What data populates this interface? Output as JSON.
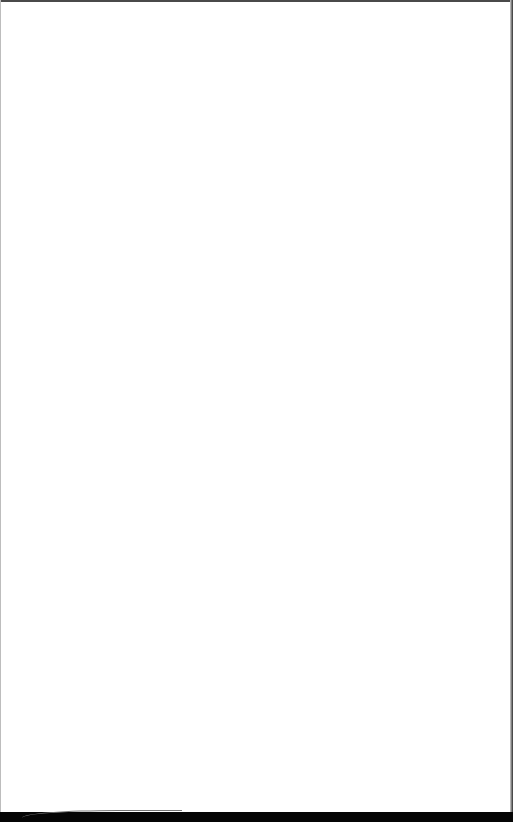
{
  "page": {
    "content": "",
    "background_color": "#ffffff",
    "border_color": "#4a4a4a",
    "bottom_bar_color": "#050505"
  }
}
